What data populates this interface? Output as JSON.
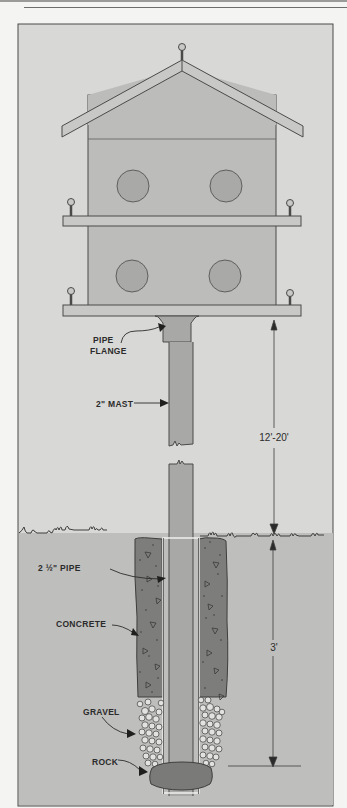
{
  "diagram": {
    "colors": {
      "sky": "#d8d8d6",
      "ground": "#bebebc",
      "house": "#bcbcba",
      "roof": "#c8c8c6",
      "hole": "#a9a9a7",
      "mast": "#a8a8a6",
      "concrete": "#7d7d7b",
      "rock": "#7a7a78",
      "line": "#4a4a48"
    },
    "labels": {
      "pipe_flange_line1": "PIPE",
      "pipe_flange_line2": "FLANGE",
      "mast": "2\" MAST",
      "pipe": "2 ½\" PIPE",
      "concrete": "CONCRETE",
      "gravel": "GRAVEL",
      "rock": "ROCK"
    },
    "dimensions": {
      "above_ground": "12'-20'",
      "below_ground": "3'"
    }
  }
}
